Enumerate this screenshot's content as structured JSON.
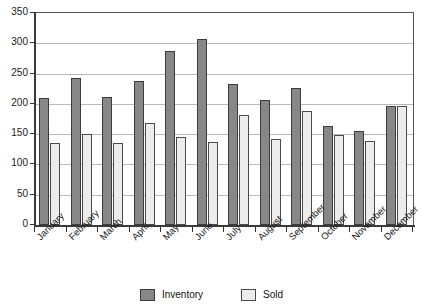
{
  "chart_data": {
    "type": "bar",
    "title": "",
    "xlabel": "",
    "ylabel": "",
    "ylim": [
      0,
      350
    ],
    "yticks": [
      0,
      50,
      100,
      150,
      200,
      250,
      300,
      350
    ],
    "grid": true,
    "legend_position": "bottom",
    "categories": [
      "January",
      "February",
      "March",
      "April",
      "May",
      "June",
      "July",
      "August",
      "September",
      "October",
      "November",
      "December"
    ],
    "series": [
      {
        "name": "Inventory",
        "color": "#878787",
        "values": [
          210,
          242,
          211,
          237,
          288,
          307,
          232,
          207,
          227,
          163,
          156,
          197
        ]
      },
      {
        "name": "Sold",
        "color": "#ececec",
        "values": [
          135,
          151,
          136,
          169,
          146,
          137,
          181,
          142,
          188,
          148,
          138,
          197
        ]
      }
    ]
  },
  "axis": {
    "y_tick_labels": [
      "350",
      "300",
      "250",
      "200",
      "150",
      "100",
      "50",
      "0"
    ]
  },
  "legend": {
    "items": [
      {
        "label": "Inventory",
        "swatch": "inventory-swatch"
      },
      {
        "label": "Sold",
        "swatch": "sold-swatch"
      }
    ]
  }
}
